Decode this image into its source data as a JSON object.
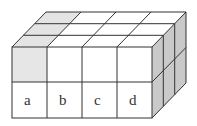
{
  "diagram": {
    "dimensions": {
      "width": 4,
      "height": 2,
      "depth": 3
    },
    "front_labels": [
      "a",
      "b",
      "c",
      "d"
    ],
    "colors": {
      "line": "#333333",
      "face_white": "#ffffff",
      "top_shaded": "#e4e4e4",
      "front_shaded": "#e6e6e6",
      "side_shaded": "#c9c9c9"
    },
    "shaded_cells": {
      "front_face": "top-left cube",
      "top_face": "left column (all 3 depth cells)",
      "right_face": "entire right side"
    }
  }
}
